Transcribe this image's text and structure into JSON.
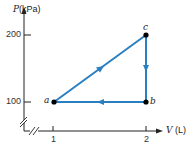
{
  "diagram": {
    "type": "pV-cycle",
    "y_axis": {
      "symbol": "P",
      "unit": "(kPa)",
      "ticks": [
        "200",
        "100"
      ]
    },
    "x_axis": {
      "symbol": "V",
      "unit": "(L)",
      "ticks": [
        "1",
        "2"
      ]
    },
    "points": [
      {
        "label": "a",
        "V": 1,
        "P": 100
      },
      {
        "label": "b",
        "V": 2,
        "P": 100
      },
      {
        "label": "c",
        "V": 2,
        "P": 200
      }
    ],
    "paths": [
      {
        "from": "a",
        "to": "c",
        "direction": "up-right"
      },
      {
        "from": "c",
        "to": "b",
        "direction": "down"
      },
      {
        "from": "b",
        "to": "a",
        "direction": "left"
      }
    ],
    "colors": {
      "path": "#2a7fc0",
      "axis": "#222222",
      "point": "#000000"
    }
  }
}
